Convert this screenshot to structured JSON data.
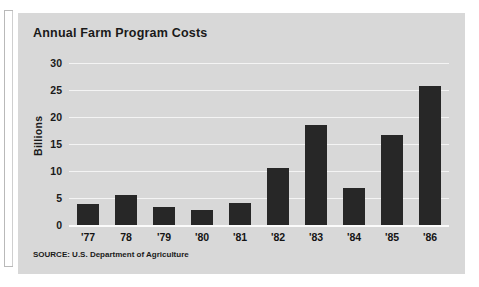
{
  "chart_data": {
    "type": "bar",
    "title": "Annual Farm Program Costs",
    "xlabel": "",
    "ylabel": "Billions",
    "categories": [
      "'77",
      "78",
      "'79",
      "'80",
      "'81",
      "'82",
      "'83",
      "'84",
      "'85",
      "'86"
    ],
    "values": [
      3.9,
      5.6,
      3.3,
      2.8,
      4.0,
      10.5,
      18.6,
      6.8,
      16.6,
      25.8
    ],
    "ylim": [
      0,
      30
    ],
    "yticks": [
      0,
      5,
      10,
      15,
      20,
      25,
      30
    ],
    "ytick_labels": [
      "0",
      "5",
      "10",
      "15",
      "20",
      "25",
      "30"
    ],
    "grid": true,
    "legend": "none",
    "bar_color": "#272727",
    "panel_color": "#d8d8d8",
    "gridline_color": "#f4f4f4"
  },
  "source_note": "SOURCE: U.S. Department of Agriculture"
}
